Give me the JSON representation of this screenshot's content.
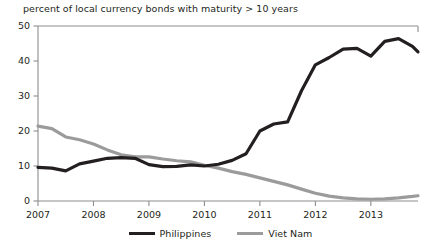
{
  "chart_data": {
    "type": "line",
    "title": "percent of local currency bonds with maturity > 10 years",
    "xlabel": "",
    "ylabel": "",
    "xlim": [
      2007,
      2013.85
    ],
    "ylim": [
      0,
      50
    ],
    "yticks": [
      0,
      10,
      20,
      30,
      40,
      50
    ],
    "xticks": [
      2007,
      2008,
      2009,
      2010,
      2011,
      2012,
      2013
    ],
    "xtick_labels": [
      "2007",
      "2008",
      "2009",
      "2010",
      "2011",
      "2012",
      "2013"
    ],
    "ytick_labels": [
      "0",
      "10",
      "20",
      "30",
      "40",
      "50"
    ],
    "grid": false,
    "legend_position": "bottom-center",
    "series": [
      {
        "name": "Philippines",
        "color": "#231f20",
        "width": 3.2,
        "points": [
          [
            2007.0,
            9.6
          ],
          [
            2007.25,
            9.4
          ],
          [
            2007.5,
            8.6
          ],
          [
            2007.75,
            10.6
          ],
          [
            2008.0,
            11.4
          ],
          [
            2008.25,
            12.2
          ],
          [
            2008.5,
            12.4
          ],
          [
            2008.75,
            12.2
          ],
          [
            2009.0,
            10.4
          ],
          [
            2009.25,
            9.8
          ],
          [
            2009.5,
            9.9
          ],
          [
            2009.75,
            10.3
          ],
          [
            2010.0,
            10.0
          ],
          [
            2010.25,
            10.5
          ],
          [
            2010.5,
            11.6
          ],
          [
            2010.75,
            13.5
          ],
          [
            2011.0,
            20.0
          ],
          [
            2011.25,
            22.0
          ],
          [
            2011.5,
            22.6
          ],
          [
            2011.75,
            31.5
          ],
          [
            2012.0,
            38.9
          ],
          [
            2012.25,
            41.0
          ],
          [
            2012.5,
            43.4
          ],
          [
            2012.75,
            43.6
          ],
          [
            2013.0,
            41.4
          ],
          [
            2013.25,
            45.6
          ],
          [
            2013.5,
            46.4
          ],
          [
            2013.75,
            44.2
          ],
          [
            2013.85,
            42.6
          ]
        ]
      },
      {
        "name": "Viet Nam",
        "color": "#9b9b9b",
        "width": 3.2,
        "points": [
          [
            2007.0,
            21.4
          ],
          [
            2007.25,
            20.7
          ],
          [
            2007.5,
            18.3
          ],
          [
            2007.75,
            17.5
          ],
          [
            2008.0,
            16.3
          ],
          [
            2008.25,
            14.6
          ],
          [
            2008.5,
            13.2
          ],
          [
            2008.75,
            12.6
          ],
          [
            2009.0,
            12.6
          ],
          [
            2009.25,
            12.0
          ],
          [
            2009.5,
            11.5
          ],
          [
            2009.75,
            11.2
          ],
          [
            2010.0,
            10.2
          ],
          [
            2010.25,
            9.4
          ],
          [
            2010.5,
            8.4
          ],
          [
            2010.75,
            7.6
          ],
          [
            2011.0,
            6.6
          ],
          [
            2011.25,
            5.6
          ],
          [
            2011.5,
            4.6
          ],
          [
            2011.75,
            3.4
          ],
          [
            2012.0,
            2.2
          ],
          [
            2012.25,
            1.4
          ],
          [
            2012.5,
            0.9
          ],
          [
            2012.75,
            0.6
          ],
          [
            2013.0,
            0.5
          ],
          [
            2013.25,
            0.6
          ],
          [
            2013.5,
            0.9
          ],
          [
            2013.75,
            1.3
          ],
          [
            2013.85,
            1.5
          ]
        ]
      }
    ],
    "legend": [
      {
        "label": "Philippines",
        "color": "#231f20"
      },
      {
        "label": "Viet Nam",
        "color": "#9b9b9b"
      }
    ]
  },
  "plot_geometry": {
    "left": 38,
    "right": 418,
    "top": 26,
    "bottom": 201
  }
}
